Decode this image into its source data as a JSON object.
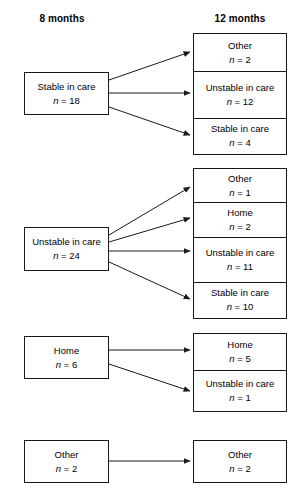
{
  "headers": {
    "left": "8 months",
    "right": "12 months"
  },
  "chart_data": {
    "type": "diagram",
    "title": "",
    "diagram_kind": "sankey-style flow / transition flowchart",
    "stage_labels": [
      "8 months",
      "12 months"
    ],
    "groups": [
      {
        "source": {
          "label": "Stable in care",
          "count": "n = 18",
          "n": 18
        },
        "targets": [
          {
            "label": "Other",
            "count": "n = 2",
            "n": 2
          },
          {
            "label": "Unstable in care",
            "count": "n = 12",
            "n": 12
          },
          {
            "label": "Stable in care",
            "count": "n = 4",
            "n": 4
          }
        ]
      },
      {
        "source": {
          "label": "Unstable in care",
          "count": "n = 24",
          "n": 24
        },
        "targets": [
          {
            "label": "Other",
            "count": "n = 1",
            "n": 1
          },
          {
            "label": "Home",
            "count": "n = 2",
            "n": 2
          },
          {
            "label": "Unstable in care",
            "count": "n = 11",
            "n": 11
          },
          {
            "label": "Stable in care",
            "count": "n = 10",
            "n": 10
          }
        ]
      },
      {
        "source": {
          "label": "Home",
          "count": "n = 6",
          "n": 6
        },
        "targets": [
          {
            "label": "Home",
            "count": "n = 5",
            "n": 5
          },
          {
            "label": "Unstable in care",
            "count": "n = 1",
            "n": 1
          }
        ]
      },
      {
        "source": {
          "label": "Other",
          "count": "n = 2",
          "n": 2
        },
        "targets": [
          {
            "label": "Other",
            "count": "n = 2",
            "n": 2
          }
        ]
      }
    ],
    "colors": {
      "stroke": "#1a1a1a",
      "background": "#ffffff",
      "text": "#000000"
    }
  }
}
